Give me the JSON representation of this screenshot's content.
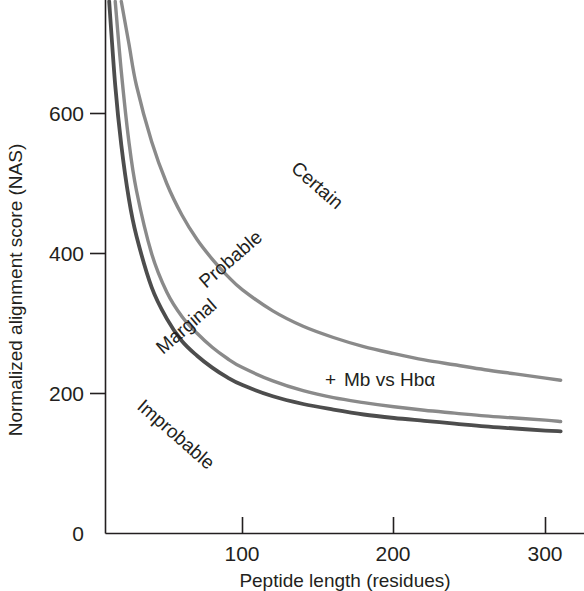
{
  "chart_data": {
    "type": "line",
    "title": "",
    "xlabel": "Peptide length (residues)",
    "ylabel": "Normalized alignment score (NAS)",
    "xlim": [
      8,
      312
    ],
    "ylim": [
      0,
      760
    ],
    "xticks": [
      100,
      200,
      300
    ],
    "xtick_labels": [
      "100",
      "200",
      "300"
    ],
    "yticks": [
      0,
      200,
      400,
      600
    ],
    "ytick_labels": [
      "0",
      "200",
      "400",
      "600"
    ],
    "grid": false,
    "legend_position": "none",
    "region_labels": [
      {
        "name": "certain",
        "text": "Certain"
      },
      {
        "name": "probable",
        "text": "Probable"
      },
      {
        "name": "marginal",
        "text": "Marginal"
      },
      {
        "name": "improbable",
        "text": "Improbable"
      }
    ],
    "annotations": [
      {
        "name": "mb-vs-hba",
        "marker": "+",
        "text": "Mb vs Hbα",
        "x": 163,
        "y": 215
      }
    ],
    "series": [
      {
        "name": "Certain / Probable boundary",
        "color": "#8a8a8a",
        "x": [
          20,
          25,
          30,
          40,
          50,
          60,
          70,
          80,
          90,
          100,
          120,
          140,
          160,
          180,
          200,
          220,
          240,
          260,
          280,
          300,
          310
        ],
        "values": [
          760,
          700,
          640,
          560,
          500,
          455,
          420,
          392,
          368,
          348,
          318,
          296,
          280,
          267,
          257,
          248,
          241,
          234,
          228,
          222,
          219
        ]
      },
      {
        "name": "Probable / Marginal boundary",
        "color": "#8a8a8a",
        "x": [
          16,
          20,
          25,
          30,
          40,
          50,
          60,
          70,
          80,
          90,
          100,
          120,
          140,
          160,
          180,
          200,
          220,
          240,
          260,
          280,
          300,
          310
        ],
        "values": [
          760,
          660,
          560,
          490,
          400,
          345,
          310,
          286,
          266,
          250,
          237,
          218,
          204,
          194,
          187,
          181,
          176,
          172,
          168,
          165,
          162,
          160
        ]
      },
      {
        "name": "Marginal / Improbable boundary",
        "color": "#4d4d4d",
        "x": [
          12,
          16,
          20,
          25,
          30,
          40,
          50,
          60,
          70,
          80,
          90,
          100,
          120,
          140,
          160,
          180,
          200,
          220,
          240,
          260,
          280,
          300,
          310
        ],
        "values": [
          760,
          640,
          555,
          478,
          425,
          352,
          307,
          275,
          254,
          237,
          223,
          212,
          196,
          185,
          177,
          170,
          165,
          161,
          157,
          153,
          150,
          147,
          146
        ]
      }
    ]
  },
  "axis": {
    "x_label": "Peptide length (residues)",
    "y_label": "Normalized alignment score (NAS)",
    "x_ticks": [
      "100",
      "200",
      "300"
    ],
    "y_ticks": [
      "600",
      "400",
      "200",
      "0"
    ]
  },
  "labels": {
    "certain": "Certain",
    "probable": "Probable",
    "marginal": "Marginal",
    "improbable": "Improbable",
    "data_point": "Mb vs Hbα",
    "data_point_marker": "+"
  },
  "colors": {
    "curve_light": "#8a8a8a",
    "curve_dark": "#4d4d4d",
    "axis": "#231f20",
    "text": "#231f20",
    "background": "#ffffff"
  }
}
